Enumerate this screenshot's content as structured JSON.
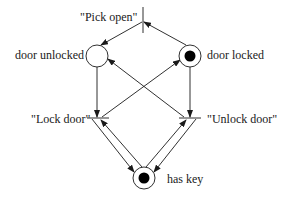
{
  "diagram": {
    "type": "petri-net",
    "colors": {
      "stroke": "#1a1a1a",
      "background": "#ffffff",
      "token": "#000000"
    },
    "places": [
      {
        "id": "door_unlocked",
        "label": "door unlocked",
        "tokens": 0
      },
      {
        "id": "door_locked",
        "label": "door locked",
        "tokens": 1
      },
      {
        "id": "has_key",
        "label": "has key",
        "tokens": 1
      }
    ],
    "transitions": [
      {
        "id": "pick_open",
        "label": "\"Pick open\""
      },
      {
        "id": "lock_door",
        "label": "\"Lock door\""
      },
      {
        "id": "unlock_door",
        "label": "\"Unlock door\""
      }
    ],
    "arcs": [
      {
        "from": "door_locked",
        "to": "pick_open"
      },
      {
        "from": "pick_open",
        "to": "door_unlocked"
      },
      {
        "from": "door_unlocked",
        "to": "lock_door"
      },
      {
        "from": "lock_door",
        "to": "door_locked"
      },
      {
        "from": "door_locked",
        "to": "unlock_door"
      },
      {
        "from": "unlock_door",
        "to": "door_unlocked"
      },
      {
        "from": "has_key",
        "to": "lock_door"
      },
      {
        "from": "lock_door",
        "to": "has_key"
      },
      {
        "from": "has_key",
        "to": "unlock_door"
      },
      {
        "from": "unlock_door",
        "to": "has_key"
      }
    ]
  }
}
